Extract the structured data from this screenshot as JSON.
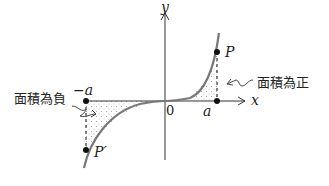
{
  "diagram": {
    "axes": {
      "x_label": "x",
      "y_label": "y",
      "origin_label": "0"
    },
    "ticks": {
      "neg_a": "−a",
      "pos_a": "a"
    },
    "points": {
      "P": "P",
      "P_prime": "P′"
    },
    "annotations": {
      "positive_area": "面積為正",
      "negative_area": "面積為負"
    },
    "colors": {
      "curve": "#777777",
      "axis": "#333333",
      "point": "#111111",
      "shading_dots": "#999999"
    }
  }
}
